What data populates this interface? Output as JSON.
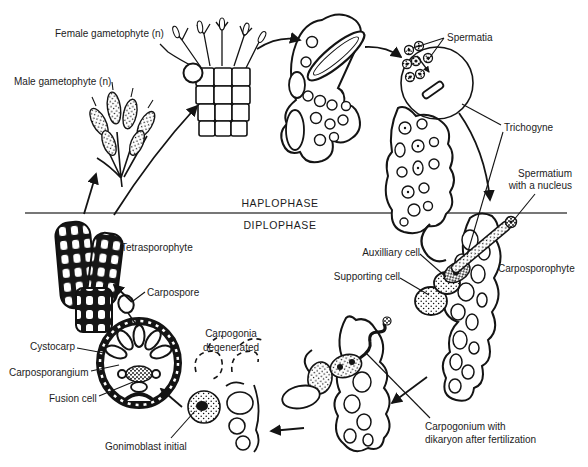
{
  "canvas": {
    "background": "#ffffff",
    "ink": "#141414",
    "divider_color": "#4a4a4a"
  },
  "phase_divider": {
    "above": "HAPLOPHASE",
    "below": "DIPLOPHASE"
  },
  "labels": {
    "female_gametophyte": "Female gametophyte (n)",
    "male_gametophyte": "Male gametophyte (n)",
    "spermatia": "Spermatia",
    "trichogyne": "Trichogyne",
    "spermatium": {
      "line1": "Spermatium",
      "line2": "with a nucleus"
    },
    "auxiliary_cell": "Auxilliary cell",
    "supporting_cell": "Supporting cell",
    "carposporophyte": "Carposporophyte",
    "tetrasporophyte": "Tetrasporophyte",
    "carpospore": "Carpospore",
    "cystocarp": "Cystocarp",
    "carposporangium": "Carposporangium",
    "fusion_cell": "Fusion cell",
    "gonimoblast_initial": "Gonimoblast initial",
    "carpogonia_degenerated": {
      "line1": "Carpogonia",
      "line2": "degenerated"
    },
    "carpogonium_dikaryon": {
      "line1": "Carpogonium with",
      "line2": "dikaryon after fertilization"
    }
  }
}
